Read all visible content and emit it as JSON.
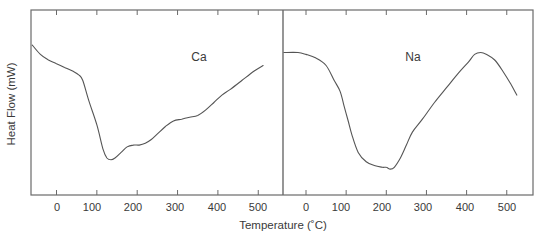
{
  "chart_data": [
    {
      "type": "line",
      "panel": "left",
      "title": "",
      "series_label": "Ca",
      "xlabel": "Temperature (°C)",
      "ylabel": "Heat Flow (mW)",
      "xlim": [
        -60,
        535
      ],
      "ylim": [
        0,
        100
      ],
      "y_units_note": "relative (no y tick labels shown)",
      "x_ticks": [
        0,
        100,
        200,
        300,
        400,
        500
      ],
      "x_tick_labels": [
        "0",
        "100",
        "200",
        "300",
        "400",
        "500"
      ],
      "grid": false,
      "series": [
        {
          "name": "Ca",
          "x": [
            -60,
            -40,
            -20,
            0,
            20,
            40,
            55,
            65,
            80,
            100,
            115,
            125,
            135,
            145,
            160,
            175,
            190,
            205,
            220,
            235,
            250,
            270,
            290,
            310,
            330,
            350,
            370,
            390,
            410,
            430,
            460,
            490,
            512,
            512
          ],
          "y": [
            81,
            76,
            73,
            71,
            69,
            67,
            65,
            62,
            51,
            38,
            25,
            20,
            19,
            20,
            23,
            26,
            27,
            27,
            28,
            30,
            33,
            37,
            40,
            41,
            42,
            43,
            46,
            50,
            54,
            57,
            62,
            67,
            70,
            70
          ]
        }
      ]
    },
    {
      "type": "line",
      "panel": "right",
      "title": "",
      "series_label": "Na",
      "xlabel": "Temperature (°C)",
      "ylabel": "Heat Flow (mW)",
      "xlim": [
        -55,
        535
      ],
      "ylim": [
        0,
        100
      ],
      "y_units_note": "relative (no y tick labels shown)",
      "x_ticks": [
        0,
        100,
        200,
        300,
        400,
        500
      ],
      "x_tick_labels": [
        "0",
        "100",
        "200",
        "300",
        "400",
        "500"
      ],
      "grid": false,
      "series": [
        {
          "name": "Na",
          "x": [
            -55,
            -20,
            0,
            25,
            50,
            70,
            85,
            95,
            105,
            115,
            130,
            150,
            170,
            190,
            200,
            210,
            220,
            235,
            250,
            265,
            290,
            320,
            350,
            380,
            405,
            420,
            435,
            450,
            470,
            490,
            510,
            525
          ],
          "y": [
            77,
            77,
            76,
            74,
            70,
            62,
            56,
            48,
            40,
            32,
            23,
            18,
            16,
            15,
            15,
            14,
            15,
            20,
            27,
            34,
            41,
            50,
            58,
            66,
            72,
            76,
            77,
            76,
            73,
            67,
            60,
            54
          ]
        }
      ]
    }
  ],
  "labels": {
    "ylabel": "Heat Flow (mW)",
    "xlabel": "Temperature (˚C)",
    "left_series": "Ca",
    "right_series": "Na",
    "left_ticks": [
      "0",
      "100",
      "200",
      "300",
      "400",
      "500"
    ],
    "right_ticks": [
      "0",
      "100",
      "200",
      "300",
      "400",
      "500"
    ]
  },
  "colors": {
    "curve": "#555555",
    "frame": "#6a6a6a",
    "text": "#3a3a3a",
    "background": "#ffffff"
  }
}
